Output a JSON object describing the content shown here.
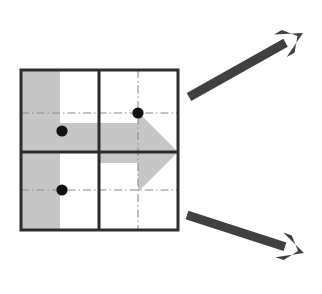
{
  "figure": {
    "title": "",
    "background_color": "#ffffff",
    "canvas": {
      "width": 322,
      "height": 294
    }
  },
  "colors": {
    "shape_fill": "#c6c6c6",
    "shape_fill_alt": "#c9c9c9",
    "frame_stroke": "#2e2e2e",
    "divider_stroke": "#2b2b2b",
    "dashdot_stroke": "#8a8a8a",
    "marker_fill": "#111111",
    "callout_arrow_fill": "#404040",
    "white": "#ffffff"
  },
  "grid_square": {
    "label": "quadrant-square",
    "x": 21,
    "y": 70,
    "width": 157,
    "height": 160,
    "border_width": 3,
    "divider_x": 99,
    "divider_y": 152,
    "divider_width": 3,
    "quadrants": [
      {
        "name": "upper-left",
        "fill_left_band": true
      },
      {
        "name": "upper-right",
        "fill_left_band": false
      },
      {
        "name": "lower-left",
        "fill_left_band": true
      },
      {
        "name": "lower-right",
        "fill_left_band": false
      }
    ]
  },
  "left_band": {
    "label": "left-gray-band",
    "x": 21,
    "y": 70,
    "width": 39,
    "height": 160
  },
  "big_arrow": {
    "label": "large-gray-right-arrow",
    "direction": "right",
    "shaft_left": 60,
    "shaft_top": 123,
    "shaft_bottom": 182,
    "notch_x": 99,
    "notch_top": 152,
    "notch_bottom": 182,
    "head_base_x": 138,
    "head_tip_x": 178,
    "head_top_y": 112,
    "head_bottom_y": 192,
    "head_tip_y": 152,
    "polygon_points": "60,123 138,123 138,112 178,152 138,192 138,163 99,163 99,152 60,152"
  },
  "markers": [
    {
      "name": "marker-upper-left",
      "cx": 62,
      "cy": 131,
      "r": 5.6
    },
    {
      "name": "marker-upper-right",
      "cx": 138,
      "cy": 113,
      "r": 5.6
    },
    {
      "name": "marker-lower-left",
      "cx": 62,
      "cy": 190,
      "r": 5.6
    }
  ],
  "dashdot_lines": [
    {
      "name": "dashdot-h-upper",
      "x1": 21,
      "y1": 113,
      "x2": 178,
      "y2": 113,
      "orientation": "horizontal"
    },
    {
      "name": "dashdot-h-lower",
      "x1": 21,
      "y1": 190,
      "x2": 178,
      "y2": 190,
      "orientation": "horizontal"
    },
    {
      "name": "dashdot-v-right",
      "x1": 138,
      "y1": 70,
      "x2": 138,
      "y2": 230,
      "orientation": "vertical"
    }
  ],
  "callout_arrows": [
    {
      "name": "callout-arrow-up-right",
      "direction": "up-right",
      "tail_x": 189,
      "tail_y": 97,
      "tip_x": 303,
      "tip_y": 33,
      "stroke_width": 9
    },
    {
      "name": "callout-arrow-down-right",
      "direction": "down-right",
      "tail_x": 187,
      "tail_y": 215,
      "tip_x": 304,
      "tip_y": 253,
      "stroke_width": 9
    }
  ]
}
